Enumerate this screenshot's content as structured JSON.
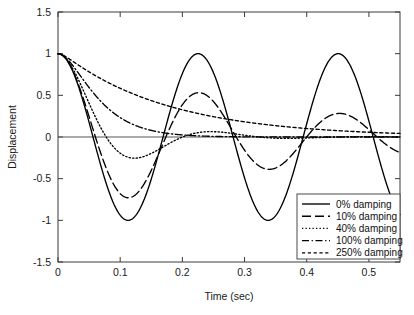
{
  "chart_data": {
    "type": "line",
    "title": "",
    "xlabel": "Time (sec)",
    "ylabel": "Displacement",
    "xlim": [
      0,
      0.55
    ],
    "ylim": [
      -1.5,
      1.5
    ],
    "xticks": [
      "0",
      "0.1",
      "0.2",
      "0.3",
      "0.4",
      "0.5"
    ],
    "xtick_values": [
      0,
      0.1,
      0.2,
      0.3,
      0.4,
      0.5
    ],
    "yticks": [
      "1.5",
      "1",
      "0.5",
      "0",
      "-0.5",
      "-1",
      "-1.5"
    ],
    "ytick_values": [
      1.5,
      1,
      0.5,
      0,
      -0.5,
      -1,
      -1.5
    ],
    "grid": false,
    "legend_position": "lower right",
    "natural_period_sec": 0.2253,
    "natural_frequency_rad_s": 27.89,
    "initial_displacement": 1,
    "series": [
      {
        "name": "0% damping",
        "damping_ratio": 0.0,
        "linestyle": "solid",
        "color": "#000000",
        "x": [
          0,
          0.0282,
          0.0563,
          0.0845,
          0.1127,
          0.1408,
          0.169,
          0.1972,
          0.2253,
          0.2535,
          0.2817,
          0.3098,
          0.338,
          0.3662,
          0.3943,
          0.4225,
          0.4507,
          0.4788,
          0.507,
          0.5352,
          0.55
        ],
        "y": [
          1,
          0.707,
          0,
          -0.707,
          -1,
          -0.707,
          0,
          0.707,
          1,
          0.707,
          0,
          -0.707,
          -1,
          -0.707,
          0,
          0.707,
          1,
          0.707,
          0,
          -0.707,
          -0.92
        ]
      },
      {
        "name": "10% damping",
        "damping_ratio": 0.1,
        "linestyle": "dashed",
        "color": "#000000",
        "x": [
          0,
          0.0283,
          0.0566,
          0.085,
          0.1133,
          0.1416,
          0.1699,
          0.2265,
          0.2548,
          0.3115,
          0.3398,
          0.3964,
          0.4247,
          0.453,
          0.5097,
          0.538,
          0.55
        ],
        "y": [
          1,
          0.77,
          0.1,
          -0.5,
          -0.73,
          -0.56,
          -0.06,
          0.52,
          0.47,
          -0.03,
          -0.38,
          -0.04,
          0.22,
          0.28,
          0.02,
          -0.15,
          -0.19
        ]
      },
      {
        "name": "40% damping",
        "damping_ratio": 0.4,
        "linestyle": "dotted",
        "color": "#000000",
        "x": [
          0,
          0.0246,
          0.0492,
          0.0737,
          0.0983,
          0.1229,
          0.1475,
          0.172,
          0.1966,
          0.2212,
          0.2458,
          0.2949,
          0.3441,
          0.3932,
          0.4424,
          0.4916,
          0.55
        ],
        "y": [
          1,
          0.74,
          0.37,
          0.03,
          -0.16,
          -0.24,
          -0.22,
          -0.16,
          -0.08,
          -0.01,
          0.03,
          0.06,
          0.04,
          0.02,
          0.01,
          0.0,
          0.0
        ]
      },
      {
        "name": "100% damping",
        "damping_ratio": 1.0,
        "linestyle": "dashdot",
        "color": "#000000",
        "x": [
          0,
          0.025,
          0.05,
          0.075,
          0.1,
          0.125,
          0.15,
          0.175,
          0.2,
          0.25,
          0.3,
          0.35,
          0.4,
          0.45,
          0.5,
          0.55
        ],
        "y": [
          1,
          0.84,
          0.6,
          0.41,
          0.28,
          0.18,
          0.12,
          0.08,
          0.05,
          0.02,
          0.01,
          0.0,
          0.0,
          0.0,
          0.0,
          0.0
        ]
      },
      {
        "name": "250% damping",
        "damping_ratio": 2.5,
        "linestyle": "finedash",
        "color": "#000000",
        "x": [
          0,
          0.03,
          0.06,
          0.09,
          0.12,
          0.15,
          0.18,
          0.21,
          0.24,
          0.27,
          0.3,
          0.33,
          0.36,
          0.39,
          0.42,
          0.45,
          0.48,
          0.51,
          0.55
        ],
        "y": [
          1,
          0.88,
          0.77,
          0.66,
          0.57,
          0.49,
          0.42,
          0.36,
          0.31,
          0.26,
          0.22,
          0.19,
          0.16,
          0.14,
          0.12,
          0.1,
          0.085,
          0.07,
          0.055
        ]
      }
    ],
    "legend_entries": [
      {
        "label": "0% damping",
        "linestyle": "solid"
      },
      {
        "label": "10% damping",
        "linestyle": "dashed"
      },
      {
        "label": "40% damping",
        "linestyle": "dotted"
      },
      {
        "label": "100% damping",
        "linestyle": "dashdot"
      },
      {
        "label": "250% damping",
        "linestyle": "finedash"
      }
    ]
  }
}
